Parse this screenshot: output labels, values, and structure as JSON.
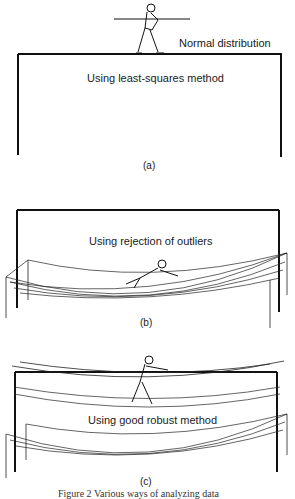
{
  "panels": [
    {
      "id": "a",
      "sublabel": "(a)",
      "labels": [
        "Normal distribution",
        "Using least-squares method"
      ]
    },
    {
      "id": "b",
      "sublabel": "(b)",
      "labels": [
        "Using rejection of outliers"
      ]
    },
    {
      "id": "c",
      "sublabel": "(c)",
      "labels": [
        "Using good robust method"
      ]
    }
  ],
  "caption": "Figure 2   Various ways of analyzing data"
}
